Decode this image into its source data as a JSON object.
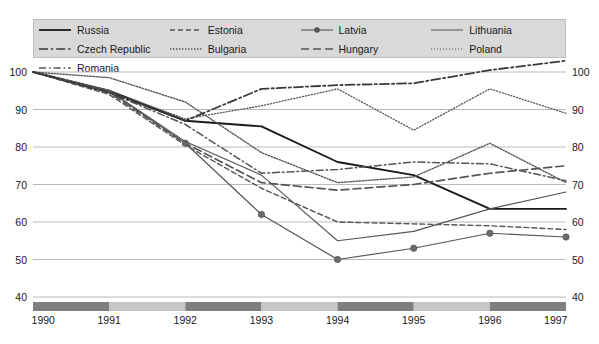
{
  "legend": {
    "items": [
      {
        "name": "Russia",
        "style": "solid",
        "color": "#1a1a1a",
        "width": 1.8,
        "marker": "none"
      },
      {
        "name": "Estonia",
        "style": "dash-dot-short",
        "color": "#555555",
        "width": 1.3,
        "marker": "none"
      },
      {
        "name": "Latvia",
        "style": "solid-marker",
        "color": "#555555",
        "width": 1.1,
        "marker": "circle"
      },
      {
        "name": "Lithuania",
        "style": "solid-thin",
        "color": "#555555",
        "width": 1.0,
        "marker": "none"
      },
      {
        "name": "Czech Republic",
        "style": "dash-dot",
        "color": "#3a3a3a",
        "width": 1.6,
        "marker": "none"
      },
      {
        "name": "Bulgaria",
        "style": "fine-dot",
        "color": "#555555",
        "width": 1.3,
        "marker": "none"
      },
      {
        "name": "Hungary",
        "style": "long-dash",
        "color": "#555555",
        "width": 1.6,
        "marker": "none"
      },
      {
        "name": "Poland",
        "style": "dotted",
        "color": "#555555",
        "width": 1.2,
        "marker": "none"
      },
      {
        "name": "Romania",
        "style": "dash-dot-long",
        "color": "#555555",
        "width": 1.4,
        "marker": "none"
      }
    ],
    "order": [
      "Russia",
      "Estonia",
      "Latvia",
      "Lithuania",
      "Czech Republic",
      "Bulgaria",
      "Hungary",
      "Poland",
      "Romania"
    ]
  },
  "chart_data": {
    "type": "line",
    "title": "",
    "subtitle": "",
    "xlabel": "",
    "ylabel": "",
    "x": [
      1990,
      1991,
      1992,
      1993,
      1994,
      1995,
      1996,
      1997
    ],
    "xtick_labels": [
      "1990",
      "1991",
      "1992",
      "1993",
      "1994",
      "1995",
      "1996",
      "1997"
    ],
    "ytick_labels": [
      "100",
      "90",
      "80",
      "70",
      "60",
      "50",
      "40"
    ],
    "ylim": [
      40,
      104
    ],
    "yticks": [
      40,
      50,
      60,
      70,
      80,
      90,
      100
    ],
    "grid": true,
    "grid_axis": "y",
    "legend_position": "top",
    "axis_band_colors": [
      "#7f7f7f",
      "#c6c6c6"
    ],
    "series": [
      {
        "name": "Russia",
        "style": "solid",
        "color": "#1a1a1a",
        "width": 1.9,
        "marker": "none",
        "values": [
          100,
          95.0,
          87.0,
          85.5,
          76.0,
          72.5,
          63.5,
          63.5
        ]
      },
      {
        "name": "Bulgaria",
        "style": "fine-dot",
        "color": "#555555",
        "width": 1.4,
        "marker": "none",
        "values": [
          100,
          98.5,
          92.0,
          78.5,
          70.5,
          72.0,
          81.0,
          70.5
        ]
      },
      {
        "name": "Estonia",
        "style": "dash-dot-short",
        "color": "#555555",
        "width": 1.4,
        "marker": "none",
        "values": [
          100,
          94.0,
          80.5,
          69.0,
          60.0,
          59.5,
          59.0,
          58.0
        ]
      },
      {
        "name": "Hungary",
        "style": "long-dash",
        "color": "#555555",
        "width": 1.7,
        "marker": "none",
        "values": [
          100,
          94.5,
          81.0,
          70.5,
          68.5,
          70.0,
          73.0,
          75.0
        ]
      },
      {
        "name": "Latvia",
        "style": "solid-marker",
        "color": "#555555",
        "width": 1.2,
        "marker": "circle",
        "values": [
          100,
          95.0,
          81.0,
          62.0,
          50.0,
          53.0,
          57.0,
          56.0
        ]
      },
      {
        "name": "Poland",
        "style": "dotted",
        "color": "#555555",
        "width": 1.3,
        "marker": "none",
        "values": [
          100,
          95.0,
          87.5,
          91.0,
          95.5,
          84.5,
          95.5,
          89.0
        ]
      },
      {
        "name": "Lithuania",
        "style": "solid-thin",
        "color": "#555555",
        "width": 1.1,
        "marker": "none",
        "values": [
          100,
          95.0,
          81.5,
          72.5,
          55.0,
          57.5,
          63.5,
          68.0
        ]
      },
      {
        "name": "Romania",
        "style": "dash-dot-long",
        "color": "#555555",
        "width": 1.5,
        "marker": "none",
        "values": [
          100,
          94.5,
          86.0,
          73.0,
          74.0,
          76.0,
          75.5,
          71.0
        ]
      },
      {
        "name": "Czech Republic",
        "style": "dash-dot",
        "color": "#3a3a3a",
        "width": 1.8,
        "marker": "none",
        "values": [
          100,
          94.5,
          87.0,
          95.5,
          96.5,
          97.0,
          100.5,
          103.0
        ]
      }
    ]
  }
}
